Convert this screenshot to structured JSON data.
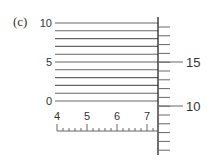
{
  "figure": {
    "panel_label": "(c)"
  },
  "left_scale": {
    "labels": [
      {
        "value": "10",
        "line_index": 0
      },
      {
        "value": "5",
        "line_index": 5
      },
      {
        "value": "0",
        "line_index": 10
      }
    ],
    "line_count": 11,
    "top_y": 23,
    "spacing": 7.8,
    "x_start": 55,
    "x_end": 158
  },
  "bottom_scale": {
    "labels": [
      "4",
      "5",
      "6",
      "7"
    ],
    "major_start_x": 57,
    "major_spacing": 30,
    "minor_per_major": 5,
    "baseline_y": 131
  },
  "right_scale": {
    "labels": [
      {
        "value": "15",
        "y": 62
      },
      {
        "value": "10",
        "y": 106
      }
    ],
    "axis_x": 158,
    "axis_top": 17,
    "axis_bottom": 155,
    "tick_spacing": 8.8,
    "first_tick_y": 27
  },
  "colors": {
    "line": "#666666",
    "axis": "#222222",
    "text": "#333333"
  }
}
